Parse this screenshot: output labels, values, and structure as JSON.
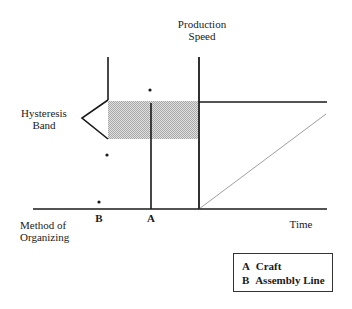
{
  "diagram": {
    "axis_labels": {
      "y_top": [
        "Production",
        "Speed"
      ],
      "x_left": [
        "Method of",
        "Organizing"
      ],
      "x_right": "Time"
    },
    "band_label": [
      "Hysteresis",
      "Band"
    ],
    "markers": {
      "a": "A",
      "b": "B"
    },
    "legend": [
      {
        "key": "A",
        "label": "Craft"
      },
      {
        "key": "B",
        "label": "Assembly Line"
      }
    ],
    "colors": {
      "line": "#1a1a1a",
      "diagonal": "#a0a0a0",
      "band": "#c4c4c4"
    }
  }
}
